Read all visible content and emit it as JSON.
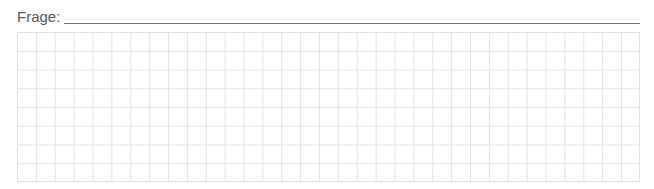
{
  "question": {
    "label": "Frage:",
    "answer_value": ""
  },
  "grid": {
    "columns": 33,
    "rows": 8,
    "line_color": "#e4e4e4"
  }
}
